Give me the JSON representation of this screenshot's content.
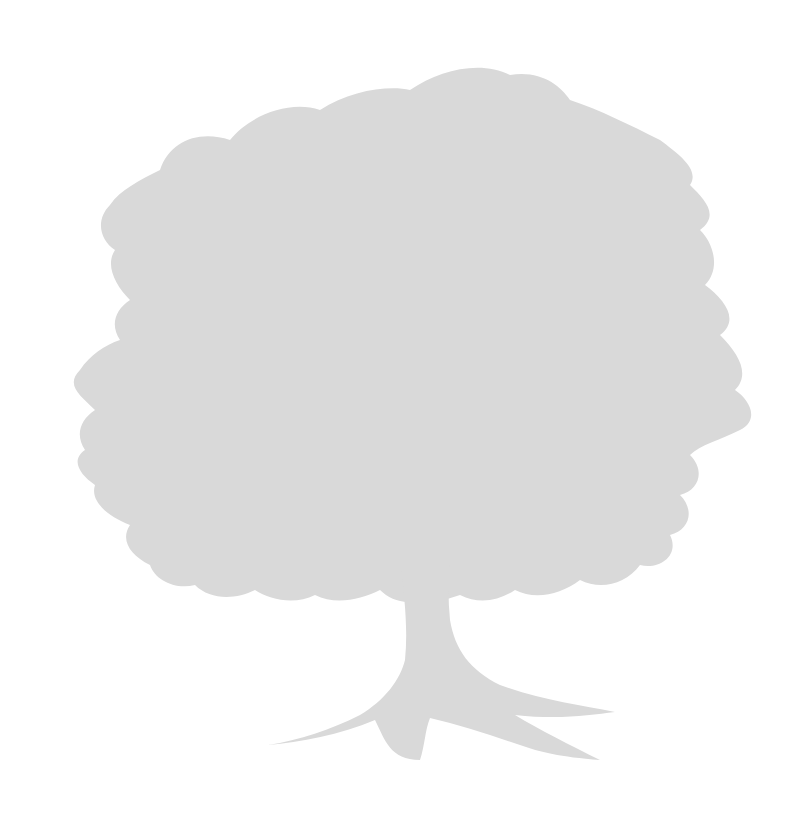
{
  "image": {
    "subject": "Tree silhouette",
    "description": "Light gray silhouette of a broad deciduous tree with a wide leafy crown and spreading roots on a white background",
    "colors": {
      "background": "#ffffff",
      "silhouette": "#d9d9d9"
    }
  }
}
